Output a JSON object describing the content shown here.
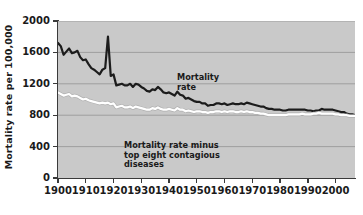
{
  "chart_data": {
    "type": "line",
    "title": "",
    "xlabel": "",
    "ylabel": "Mortality rate per 100,000",
    "xlim": [
      1900,
      2007
    ],
    "ylim": [
      0,
      2000
    ],
    "grid": true,
    "legend_position": "inline-annotations",
    "xticks": [
      1900,
      1910,
      1920,
      1930,
      1940,
      1950,
      1960,
      1970,
      1980,
      1990,
      2000
    ],
    "yticks": [
      0,
      400,
      800,
      1200,
      1600,
      2000
    ],
    "annotations": [
      {
        "name": "mortality-rate",
        "text": "Mortality\nrate",
        "series": "Mortality rate"
      },
      {
        "name": "minus-contagious",
        "text": "Mortality rate minus\ntop eight contagious\ndiseases",
        "series": "Mortality rate minus top eight contagious diseases"
      }
    ],
    "series": [
      {
        "name": "Mortality rate",
        "color": "#1c1c1c",
        "x": [
          1900,
          1901,
          1902,
          1903,
          1904,
          1905,
          1906,
          1907,
          1908,
          1909,
          1910,
          1911,
          1912,
          1913,
          1914,
          1915,
          1916,
          1917,
          1918,
          1919,
          1920,
          1921,
          1922,
          1923,
          1924,
          1925,
          1926,
          1927,
          1928,
          1929,
          1930,
          1931,
          1932,
          1933,
          1934,
          1935,
          1936,
          1937,
          1938,
          1939,
          1940,
          1941,
          1942,
          1943,
          1944,
          1945,
          1946,
          1947,
          1948,
          1949,
          1950,
          1951,
          1952,
          1953,
          1954,
          1955,
          1956,
          1957,
          1958,
          1959,
          1960,
          1961,
          1962,
          1963,
          1964,
          1965,
          1966,
          1967,
          1968,
          1969,
          1970,
          1971,
          1972,
          1973,
          1974,
          1975,
          1976,
          1977,
          1978,
          1979,
          1980,
          1981,
          1982,
          1983,
          1984,
          1985,
          1986,
          1987,
          1988,
          1989,
          1990,
          1991,
          1992,
          1993,
          1994,
          1995,
          1996,
          1997,
          1998,
          1999,
          2000,
          2001,
          2002,
          2003,
          2004,
          2005,
          2006,
          2007
        ],
        "values": [
          1720,
          1680,
          1570,
          1610,
          1650,
          1590,
          1600,
          1620,
          1540,
          1500,
          1510,
          1450,
          1400,
          1380,
          1350,
          1320,
          1380,
          1400,
          1800,
          1300,
          1320,
          1180,
          1190,
          1200,
          1180,
          1180,
          1200,
          1160,
          1200,
          1190,
          1160,
          1140,
          1110,
          1100,
          1130,
          1120,
          1160,
          1130,
          1090,
          1080,
          1090,
          1070,
          1050,
          1100,
          1060,
          1050,
          1010,
          1020,
          1000,
          980,
          970,
          970,
          950,
          950,
          920,
          930,
          930,
          950,
          950,
          940,
          950,
          930,
          940,
          950,
          940,
          940,
          950,
          940,
          960,
          950,
          940,
          930,
          920,
          910,
          910,
          890,
          880,
          880,
          870,
          870,
          870,
          860,
          860,
          870,
          870,
          870,
          870,
          870,
          870,
          870,
          860,
          860,
          850,
          860,
          860,
          880,
          870,
          870,
          870,
          870,
          860,
          850,
          840,
          840,
          820,
          810,
          810,
          800
        ]
      },
      {
        "name": "Mortality rate minus top eight contagious diseases",
        "color": "#ffffff",
        "x": [
          1900,
          1901,
          1902,
          1903,
          1904,
          1905,
          1906,
          1907,
          1908,
          1909,
          1910,
          1911,
          1912,
          1913,
          1914,
          1915,
          1916,
          1917,
          1918,
          1919,
          1920,
          1921,
          1922,
          1923,
          1924,
          1925,
          1926,
          1927,
          1928,
          1929,
          1930,
          1931,
          1932,
          1933,
          1934,
          1935,
          1936,
          1937,
          1938,
          1939,
          1940,
          1941,
          1942,
          1943,
          1944,
          1945,
          1946,
          1947,
          1948,
          1949,
          1950,
          1951,
          1952,
          1953,
          1954,
          1955,
          1956,
          1957,
          1958,
          1959,
          1960,
          1961,
          1962,
          1963,
          1964,
          1965,
          1966,
          1967,
          1968,
          1969,
          1970,
          1971,
          1972,
          1973,
          1974,
          1975,
          1976,
          1977,
          1978,
          1979,
          1980,
          1981,
          1982,
          1983,
          1984,
          1985,
          1986,
          1987,
          1988,
          1989,
          1990,
          1991,
          1992,
          1993,
          1994,
          1995,
          1996,
          1997,
          1998,
          1999,
          2000,
          2001,
          2002,
          2003,
          2004,
          2005,
          2006,
          2007
        ],
        "values": [
          1090,
          1070,
          1050,
          1060,
          1070,
          1040,
          1050,
          1040,
          1020,
          1000,
          1010,
          990,
          980,
          970,
          960,
          950,
          960,
          950,
          960,
          940,
          950,
          900,
          910,
          920,
          900,
          900,
          910,
          890,
          910,
          900,
          890,
          880,
          870,
          870,
          890,
          880,
          900,
          880,
          870,
          870,
          880,
          870,
          860,
          890,
          870,
          870,
          850,
          860,
          850,
          840,
          850,
          850,
          840,
          840,
          830,
          840,
          840,
          850,
          850,
          840,
          850,
          840,
          850,
          850,
          840,
          840,
          850,
          840,
          850,
          840,
          840,
          830,
          830,
          820,
          820,
          810,
          800,
          800,
          800,
          800,
          800,
          800,
          800,
          810,
          810,
          810,
          810,
          810,
          820,
          810,
          810,
          810,
          820,
          820,
          830,
          820,
          820,
          820,
          820,
          820,
          810,
          810,
          800,
          800,
          800,
          790,
          790,
          790
        ]
      }
    ]
  }
}
